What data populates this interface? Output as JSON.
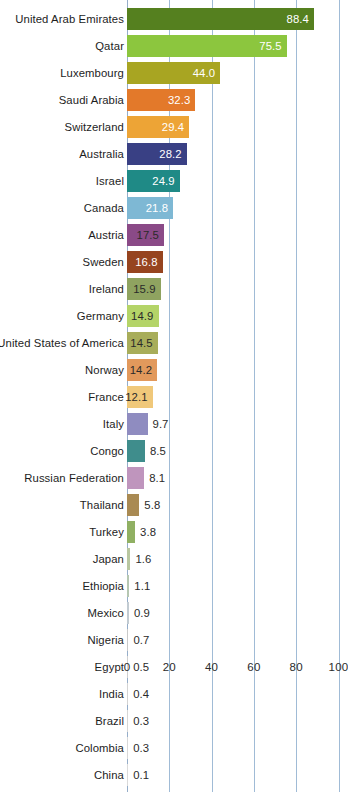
{
  "chart_data": {
    "type": "bar",
    "orientation": "horizontal",
    "title": "",
    "xlabel": "",
    "ylabel": "",
    "xlim": [
      0,
      100
    ],
    "xticks": [
      0,
      20,
      40,
      60,
      80,
      100
    ],
    "grid": true,
    "legend": false,
    "categories": [
      "United Arab Emirates",
      "Qatar",
      "Luxembourg",
      "Saudi Arabia",
      "Switzerland",
      "Australia",
      "Israel",
      "Canada",
      "Austria",
      "Sweden",
      "Ireland",
      "Germany",
      "United States of America",
      "Norway",
      "France",
      "Italy",
      "Congo",
      "Russian Federation",
      "Thailand",
      "Turkey",
      "Japan",
      "Ethiopia",
      "Mexico",
      "Nigeria",
      "Egypt",
      "India",
      "Brazil",
      "Colombia",
      "China"
    ],
    "values": [
      88.4,
      75.5,
      44.0,
      32.3,
      29.4,
      28.2,
      24.9,
      21.8,
      17.5,
      16.8,
      15.9,
      14.9,
      14.5,
      14.2,
      12.1,
      9.7,
      8.5,
      8.1,
      5.8,
      3.8,
      1.6,
      1.1,
      0.9,
      0.7,
      0.5,
      0.4,
      0.3,
      0.3,
      0.1
    ],
    "value_labels": [
      "88.4",
      "75.5",
      "44.0",
      "32.3",
      "29.4",
      "28.2",
      "24.9",
      "21.8",
      "17.5",
      "16.8",
      "15.9",
      "14.9",
      "14.5",
      "14.2",
      "12.1",
      "9.7",
      "8.5",
      "8.1",
      "5.8",
      "3.8",
      "1.6",
      "1.1",
      "0.9",
      "0.7",
      "0.5",
      "0.4",
      "0.3",
      "0.3",
      "0.1"
    ],
    "colors": [
      "#55801f",
      "#8cc63e",
      "#a8a522",
      "#e3792a",
      "#eda436",
      "#394084",
      "#1f8a86",
      "#7eb8d4",
      "#8a4a87",
      "#96441f",
      "#8fa360",
      "#b4d468",
      "#a8ad5a",
      "#e2995c",
      "#f0c87a",
      "#8f8cc0",
      "#3f8d8c",
      "#bf95bd",
      "#a98a53",
      "#90b063",
      "#b9c7a0",
      "#b6c7b2",
      "#c2cbd2",
      "#c9c9c9",
      "#cfcfcf",
      "#d3d3d3",
      "#d6d6d6",
      "#d8d8d8",
      "#dadada"
    ],
    "label_placement": [
      "inside-light",
      "inside-light",
      "inside-light",
      "inside-light",
      "inside-light",
      "inside-light",
      "inside-light",
      "inside-light",
      "inside-dark",
      "inside-light",
      "inside-dark",
      "inside-dark",
      "inside-dark",
      "inside-dark",
      "inside-dark",
      "outside",
      "outside",
      "outside",
      "outside",
      "outside",
      "outside",
      "outside",
      "outside",
      "outside",
      "outside",
      "outside",
      "outside",
      "outside",
      "outside"
    ]
  },
  "axis": {
    "tick_labels": [
      "0",
      "20",
      "40",
      "60",
      "80",
      "100"
    ],
    "gridline_color": "#9bb7d4"
  },
  "artifacts": {
    "top_cropped_text": ""
  }
}
